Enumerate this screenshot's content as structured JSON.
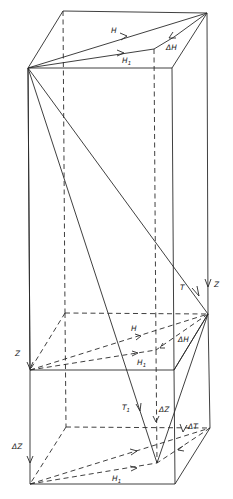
{
  "diagram": {
    "type": "3d-prism-vector-decomposition",
    "background": "#ffffff",
    "line_color": "#2a2a2a",
    "labels": {
      "top_H": "H",
      "top_H1": "H",
      "top_H1_sub": "1",
      "top_dH": "ΔH",
      "T": "T",
      "Z_right": "Z",
      "Z_left": "Z",
      "mid_H": "H",
      "mid_H1": "H",
      "mid_H1_sub": "1",
      "mid_dH": "ΔH",
      "T1": "T",
      "T1_sub": "1",
      "dZ_center": "ΔZ",
      "dT": "ΔT",
      "dZ_left": "ΔZ",
      "bot_H1": "H",
      "bot_H1_sub": "1"
    }
  }
}
